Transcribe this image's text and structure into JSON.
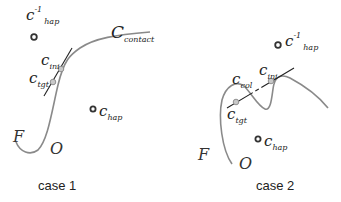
{
  "panels": [
    {
      "caption": "case 1",
      "labels": {
        "c_hap_inv": {
          "main": "c",
          "sup": "-1",
          "sub": "hap"
        },
        "c_contact": {
          "main": "C",
          "sub": "contact"
        },
        "c_ini": {
          "main": "c",
          "sub": "ini"
        },
        "c_tgt": {
          "main": "c",
          "sub": "tgt"
        },
        "c_hap": {
          "main": "c",
          "sub": "hap"
        },
        "F": "F",
        "O": "O"
      }
    },
    {
      "caption": "case 2",
      "labels": {
        "c_hap_inv": {
          "main": "c",
          "sup": "-1",
          "sub": "hap"
        },
        "c_col": {
          "main": "c",
          "sub": "col"
        },
        "c_ini": {
          "main": "c",
          "sub": "ini"
        },
        "c_tgt": {
          "main": "c",
          "sub": "tgt"
        },
        "c_hap": {
          "main": "c",
          "sub": "hap"
        },
        "F": "F",
        "O": "O"
      }
    }
  ],
  "colors": {
    "curve": "#8a8a8a",
    "tangent": "#222222",
    "point": "#333333"
  }
}
